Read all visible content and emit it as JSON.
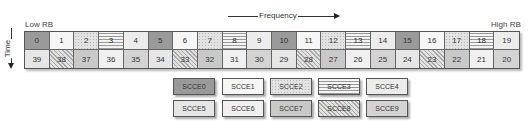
{
  "labels": {
    "low_rb": "Low RB",
    "high_rb": "High RB",
    "frequency": "Frequency",
    "time": "Time"
  },
  "grid": {
    "top_row": [
      {
        "id": "0",
        "pattern": "p0"
      },
      {
        "id": "1",
        "pattern": "p1"
      },
      {
        "id": "2",
        "pattern": "p2"
      },
      {
        "id": "3",
        "pattern": "p3"
      },
      {
        "id": "4",
        "pattern": "p4"
      },
      {
        "id": "5",
        "pattern": "p0"
      },
      {
        "id": "6",
        "pattern": "p1"
      },
      {
        "id": "7",
        "pattern": "p2"
      },
      {
        "id": "8",
        "pattern": "p3"
      },
      {
        "id": "9",
        "pattern": "p4"
      },
      {
        "id": "10",
        "pattern": "p0"
      },
      {
        "id": "11",
        "pattern": "p1"
      },
      {
        "id": "12",
        "pattern": "p2"
      },
      {
        "id": "13",
        "pattern": "p3"
      },
      {
        "id": "14",
        "pattern": "p4"
      },
      {
        "id": "15",
        "pattern": "p0"
      },
      {
        "id": "16",
        "pattern": "p1"
      },
      {
        "id": "17",
        "pattern": "p2"
      },
      {
        "id": "18",
        "pattern": "p3"
      },
      {
        "id": "19",
        "pattern": "p4"
      }
    ],
    "bottom_row": [
      {
        "id": "39",
        "pattern": "p5"
      },
      {
        "id": "38",
        "pattern": "p8"
      },
      {
        "id": "37",
        "pattern": "p7"
      },
      {
        "id": "36",
        "pattern": "p6"
      },
      {
        "id": "35",
        "pattern": "p9"
      },
      {
        "id": "34",
        "pattern": "p5"
      },
      {
        "id": "33",
        "pattern": "p8"
      },
      {
        "id": "32",
        "pattern": "p7"
      },
      {
        "id": "31",
        "pattern": "p6"
      },
      {
        "id": "30",
        "pattern": "p9"
      },
      {
        "id": "29",
        "pattern": "p5"
      },
      {
        "id": "28",
        "pattern": "p8"
      },
      {
        "id": "27",
        "pattern": "p7"
      },
      {
        "id": "26",
        "pattern": "p6"
      },
      {
        "id": "25",
        "pattern": "p9"
      },
      {
        "id": "24",
        "pattern": "p5"
      },
      {
        "id": "23",
        "pattern": "p8"
      },
      {
        "id": "22",
        "pattern": "p7"
      },
      {
        "id": "21",
        "pattern": "p6"
      },
      {
        "id": "20",
        "pattern": "p9"
      }
    ]
  },
  "legend": [
    {
      "label": "SCCE0",
      "pattern": "p0"
    },
    {
      "label": "SCCE1",
      "pattern": "p1"
    },
    {
      "label": "SCCE2",
      "pattern": "p2"
    },
    {
      "label": "SCCE3",
      "pattern": "p3"
    },
    {
      "label": "SCCE4",
      "pattern": "p4"
    },
    {
      "label": "SCCE5",
      "pattern": "p5"
    },
    {
      "label": "SCCE6",
      "pattern": "p6"
    },
    {
      "label": "SCCE7",
      "pattern": "p7"
    },
    {
      "label": "SCCE8",
      "pattern": "p8"
    },
    {
      "label": "SCCE9",
      "pattern": "p9"
    }
  ]
}
